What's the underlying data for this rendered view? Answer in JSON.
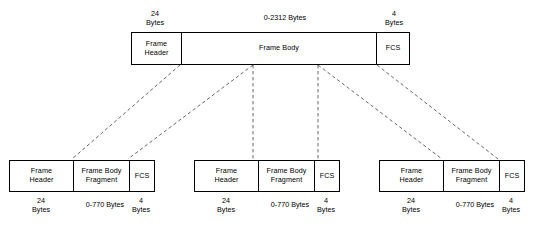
{
  "diagram": {
    "type": "block-diagram",
    "colors": {
      "background": "#ffffff",
      "stroke": "#000000",
      "connector": "#555555"
    }
  },
  "top_frame": {
    "name": "unfragmented-frame",
    "cells": [
      {
        "key": "header",
        "label_line1": "Frame",
        "label_line2": "Header"
      },
      {
        "key": "body",
        "label_line1": "Frame Body",
        "label_line2": ""
      },
      {
        "key": "fcs",
        "label_line1": "FCS",
        "label_line2": ""
      }
    ],
    "annotations": [
      {
        "key": "header",
        "line1": "24",
        "line2": "Bytes"
      },
      {
        "key": "body",
        "line1": "0-2312 Bytes",
        "line2": ""
      },
      {
        "key": "fcs",
        "line1": "4",
        "line2": "Bytes"
      }
    ]
  },
  "fragments": [
    {
      "index": 0,
      "name": "fragment-1",
      "cells": [
        {
          "key": "header",
          "label_line1": "Frame",
          "label_line2": "Header"
        },
        {
          "key": "body",
          "label_line1": "Frame Body",
          "label_line2": "Fragment"
        },
        {
          "key": "fcs",
          "label_line1": "FCS",
          "label_line2": ""
        }
      ],
      "annotations": [
        {
          "key": "header",
          "line1": "24",
          "line2": "Bytes"
        },
        {
          "key": "body",
          "line1": "0-770 Bytes",
          "line2": ""
        },
        {
          "key": "fcs",
          "line1": "4",
          "line2": "Bytes"
        }
      ]
    },
    {
      "index": 1,
      "name": "fragment-2",
      "cells": [
        {
          "key": "header",
          "label_line1": "Frame",
          "label_line2": "Header"
        },
        {
          "key": "body",
          "label_line1": "Frame Body",
          "label_line2": "Fragment"
        },
        {
          "key": "fcs",
          "label_line1": "FCS",
          "label_line2": ""
        }
      ],
      "annotations": [
        {
          "key": "header",
          "line1": "24",
          "line2": "Bytes"
        },
        {
          "key": "body",
          "line1": "0-770 Bytes",
          "line2": ""
        },
        {
          "key": "fcs",
          "line1": "4",
          "line2": "Bytes"
        }
      ]
    },
    {
      "index": 2,
      "name": "fragment-3",
      "cells": [
        {
          "key": "header",
          "label_line1": "Frame",
          "label_line2": "Header"
        },
        {
          "key": "body",
          "label_line1": "Frame Body",
          "label_line2": "Fragment"
        },
        {
          "key": "fcs",
          "label_line1": "FCS",
          "label_line2": ""
        }
      ],
      "annotations": [
        {
          "key": "header",
          "line1": "24",
          "line2": "Bytes"
        },
        {
          "key": "body",
          "line1": "0-770 Bytes",
          "line2": ""
        },
        {
          "key": "fcs",
          "line1": "4",
          "line2": "Bytes"
        }
      ]
    }
  ],
  "connectors": [
    {
      "name": "connector-1",
      "x1": 180,
      "y1": 65,
      "x2": 72,
      "y2": 159
    },
    {
      "name": "connector-2",
      "x1": 253,
      "y1": 65,
      "x2": 128,
      "y2": 159
    },
    {
      "name": "connector-3",
      "x1": 253,
      "y1": 65,
      "x2": 253,
      "y2": 159
    },
    {
      "name": "connector-4",
      "x1": 318,
      "y1": 65,
      "x2": 318,
      "y2": 159
    },
    {
      "name": "connector-5",
      "x1": 318,
      "y1": 65,
      "x2": 442,
      "y2": 159
    },
    {
      "name": "connector-6",
      "x1": 377,
      "y1": 65,
      "x2": 498,
      "y2": 159
    }
  ]
}
